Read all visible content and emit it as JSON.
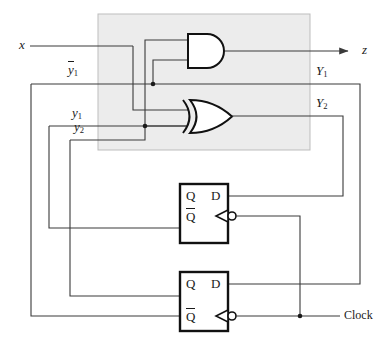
{
  "figure": {
    "type": "logic-circuit-diagram",
    "background": "#ffffff",
    "wire_color": "#3a3a3a",
    "shade_fill": "#ececec",
    "shade_stroke": "#bdbdbd"
  },
  "labels": {
    "input_x": "x",
    "output_z": "z",
    "ybar1": "y",
    "ybar1_sub": "1",
    "y1": "y",
    "y1_sub": "1",
    "y2": "y",
    "y2_sub": "2",
    "Y1": "Y",
    "Y1_sub": "1",
    "Y2": "Y",
    "Y2_sub": "2",
    "clock": "Clock"
  },
  "flipflops": [
    {
      "name": "flip-flop-1",
      "q_label": "Q",
      "qbar_label": "Q",
      "d_label": "D",
      "clock_inverted": true,
      "box": {
        "x": 180,
        "y": 184,
        "w": 48,
        "h": 59
      }
    },
    {
      "name": "flip-flop-2",
      "q_label": "Q",
      "qbar_label": "Q",
      "d_label": "D",
      "clock_inverted": true,
      "box": {
        "x": 180,
        "y": 272,
        "w": 48,
        "h": 59
      }
    }
  ],
  "gates": [
    {
      "name": "and-gate",
      "type": "AND",
      "inputs": 2,
      "output": "z",
      "x": 188,
      "y": 34,
      "w": 38,
      "h": 34
    },
    {
      "name": "xor-gate",
      "type": "XOR",
      "inputs": 3,
      "output": "Y2",
      "x": 182,
      "y": 100,
      "w": 50,
      "h": 33
    }
  ],
  "shaded_region": {
    "x": 98,
    "y": 14,
    "w": 212,
    "h": 136
  },
  "junctions": [
    {
      "name": "junction-ybar1-to-and",
      "x": 153,
      "y": 84
    },
    {
      "name": "junction-y1-to-xor",
      "x": 145,
      "y": 126
    },
    {
      "name": "junction-clock-branch",
      "x": 300,
      "y": 316
    }
  ]
}
